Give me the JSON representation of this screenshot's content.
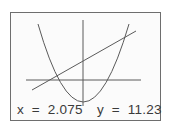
{
  "screen": {
    "readout": {
      "x_label": "x",
      "x_eq": "=",
      "x_value": "2.075",
      "y_label": "y",
      "y_eq": "=",
      "y_value": "11.23",
      "x_text": "x  =  2.075",
      "y_text": "y  =  11.23"
    }
  },
  "graph": {
    "curves": [
      {
        "name": "parabola",
        "type": "quadratic"
      },
      {
        "name": "line",
        "type": "linear"
      }
    ],
    "axes": {
      "x_axis": true,
      "y_axis": true
    },
    "colors": {
      "frame": "#6e6e6e",
      "curve": "#5a5a5a",
      "text": "#3a3a3a",
      "background": "#fbfbfb"
    }
  }
}
